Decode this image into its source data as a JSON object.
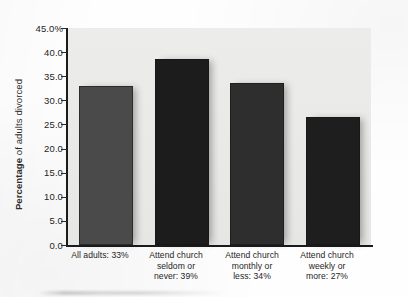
{
  "chart_data": {
    "type": "bar",
    "title": "",
    "subtitle": "",
    "xlabel": "",
    "ylabel": "Percentage of adults divorced",
    "ylabel_bold_prefix": "Percentage",
    "ylabel_rest": " of adults divorced",
    "ylim": [
      0,
      45
    ],
    "grid": false,
    "legend": "none",
    "y_tick_labels": [
      "45.0%",
      "40.0",
      "35.0",
      "30.0",
      "25.0",
      "20.0",
      "15.0",
      "10.0",
      "5.0",
      "0.0"
    ],
    "y_tick_values": [
      45,
      40,
      35,
      30,
      25,
      20,
      15,
      10,
      5,
      0
    ],
    "categories": [
      "All adults: 33%",
      "Attend church seldom or never: 39%",
      "Attend church monthly or less: 34%",
      "Attend church weekly or more: 27%"
    ],
    "category_lines": [
      [
        "All adults: 33%"
      ],
      [
        "Attend church",
        "seldom or",
        "never: 39%"
      ],
      [
        "Attend church",
        "monthly or",
        "less: 34%"
      ],
      [
        "Attend church",
        "weekly or",
        "more: 27%"
      ]
    ],
    "values": [
      33.0,
      38.5,
      33.5,
      26.5
    ],
    "value_labels": [
      "33%",
      "39%",
      "34%",
      "27%"
    ],
    "bar_colors": [
      "#4a4a4a",
      "#1c1c1c",
      "#2e2e2e",
      "#1e1e1e"
    ]
  },
  "style": {
    "plot_background": "#e9e9e7",
    "page_background": "#fefefe",
    "axis_color": "#1b1b1b",
    "text_color": "#1f1f1f"
  }
}
